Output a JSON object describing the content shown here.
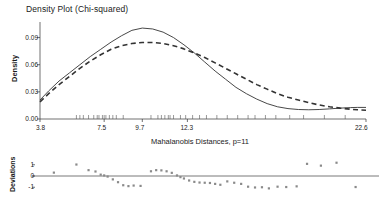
{
  "chart_data": [
    {
      "type": "line",
      "title": "Density Plot (Chi-squared)",
      "xlabel": "Mahalanobis Distances, p=11",
      "ylabel": "Density",
      "xlim": [
        3.8,
        22.6
      ],
      "ylim": [
        0.0,
        0.105
      ],
      "xticks": [
        3.8,
        7.5,
        9.7,
        12.3,
        22.6
      ],
      "xticklabels": [
        "3.8",
        "7.5",
        "9.7",
        "12.3",
        "22.6"
      ],
      "yticks": [
        0.0,
        0.03,
        0.06,
        0.09
      ],
      "yticklabels": [
        "0.00",
        "0.03",
        "0.06",
        "0.09"
      ],
      "grid": false,
      "legend": "none",
      "series": [
        {
          "name": "empirical-density",
          "style": "solid",
          "color": "#333333",
          "x": [
            3.8,
            4.3,
            4.9,
            5.5,
            6.1,
            6.7,
            7.3,
            7.9,
            8.5,
            9.1,
            9.7,
            10.3,
            10.9,
            11.5,
            12.1,
            12.7,
            13.3,
            13.9,
            14.5,
            15.1,
            15.7,
            16.3,
            16.9,
            17.5,
            18.1,
            18.7,
            19.3,
            19.9,
            20.5,
            21.1,
            21.7,
            22.1,
            22.6
          ],
          "y": [
            0.021,
            0.031,
            0.042,
            0.051,
            0.06,
            0.069,
            0.077,
            0.085,
            0.092,
            0.098,
            0.1005,
            0.0995,
            0.096,
            0.09,
            0.082,
            0.073,
            0.063,
            0.053,
            0.044,
            0.035,
            0.028,
            0.022,
            0.017,
            0.0135,
            0.0115,
            0.0105,
            0.0102,
            0.0105,
            0.0112,
            0.012,
            0.0126,
            0.0128,
            0.0128
          ]
        },
        {
          "name": "theoretical-chi-squared-density",
          "style": "dashed",
          "color": "#333333",
          "x": [
            3.8,
            4.3,
            4.9,
            5.5,
            6.1,
            6.7,
            7.3,
            7.9,
            8.5,
            9.1,
            9.7,
            10.3,
            10.9,
            11.5,
            12.1,
            12.7,
            13.3,
            13.9,
            14.5,
            15.1,
            15.7,
            16.3,
            16.9,
            17.5,
            18.1,
            18.7,
            19.3,
            19.9,
            20.5,
            21.1,
            21.7,
            22.1,
            22.6
          ],
          "y": [
            0.019,
            0.028,
            0.038,
            0.047,
            0.056,
            0.064,
            0.071,
            0.077,
            0.081,
            0.0835,
            0.0845,
            0.0845,
            0.0835,
            0.081,
            0.0775,
            0.073,
            0.068,
            0.062,
            0.056,
            0.05,
            0.044,
            0.038,
            0.033,
            0.028,
            0.024,
            0.021,
            0.018,
            0.0155,
            0.0135,
            0.012,
            0.0108,
            0.0102,
            0.0097
          ]
        }
      ],
      "rug_marks": [
        5.9,
        6.1,
        6.3,
        6.6,
        6.9,
        7.1,
        7.2,
        7.4,
        7.5,
        7.6,
        7.8,
        8.0,
        8.2,
        8.6,
        10.2,
        10.6,
        10.8,
        11.0,
        11.2,
        11.3,
        11.5,
        11.9,
        12.2,
        12.6,
        13.0,
        13.4,
        14.0,
        14.6,
        15.2,
        15.8,
        16.2,
        16.8,
        17.4,
        18.2,
        19.0,
        20.2,
        21.4
      ]
    },
    {
      "type": "scatter",
      "title": "",
      "xlabel": "",
      "ylabel": "Deviations",
      "xlim": [
        3.8,
        22.6
      ],
      "ylim": [
        -1.6,
        1.6
      ],
      "yticks": [
        -1,
        0,
        1
      ],
      "yticklabels": [
        "-1",
        "0",
        "1"
      ],
      "grid": false,
      "legend": "none",
      "reference_line": 0,
      "marker_color": "#8a8a8a",
      "points": [
        {
          "x": 4.6,
          "y": 0.3
        },
        {
          "x": 5.9,
          "y": 1.02
        },
        {
          "x": 6.6,
          "y": 0.52
        },
        {
          "x": 7.0,
          "y": 0.4
        },
        {
          "x": 7.3,
          "y": 0.12
        },
        {
          "x": 7.5,
          "y": 0.05
        },
        {
          "x": 7.7,
          "y": -0.05
        },
        {
          "x": 8.0,
          "y": -0.3
        },
        {
          "x": 8.3,
          "y": -0.55
        },
        {
          "x": 8.6,
          "y": -0.82
        },
        {
          "x": 8.9,
          "y": -0.9
        },
        {
          "x": 9.2,
          "y": -0.85
        },
        {
          "x": 9.6,
          "y": -0.88
        },
        {
          "x": 10.2,
          "y": 0.42
        },
        {
          "x": 10.5,
          "y": 0.52
        },
        {
          "x": 10.8,
          "y": 0.5
        },
        {
          "x": 11.1,
          "y": 0.42
        },
        {
          "x": 11.4,
          "y": 0.28
        },
        {
          "x": 11.7,
          "y": 0.05
        },
        {
          "x": 11.9,
          "y": -0.1
        },
        {
          "x": 12.1,
          "y": -0.22
        },
        {
          "x": 12.4,
          "y": -0.4
        },
        {
          "x": 12.7,
          "y": -0.52
        },
        {
          "x": 13.0,
          "y": -0.58
        },
        {
          "x": 13.3,
          "y": -0.6
        },
        {
          "x": 13.6,
          "y": -0.62
        },
        {
          "x": 13.9,
          "y": -0.7
        },
        {
          "x": 14.2,
          "y": -0.78
        },
        {
          "x": 14.6,
          "y": -0.48
        },
        {
          "x": 15.0,
          "y": -0.6
        },
        {
          "x": 15.4,
          "y": -0.7
        },
        {
          "x": 15.8,
          "y": -0.95
        },
        {
          "x": 16.2,
          "y": -1.02
        },
        {
          "x": 16.6,
          "y": -1.0
        },
        {
          "x": 17.0,
          "y": -1.1
        },
        {
          "x": 17.5,
          "y": -0.95
        },
        {
          "x": 18.0,
          "y": -0.98
        },
        {
          "x": 18.6,
          "y": -0.92
        },
        {
          "x": 19.2,
          "y": 1.08
        },
        {
          "x": 20.0,
          "y": 0.92
        },
        {
          "x": 20.9,
          "y": 1.18
        },
        {
          "x": 22.0,
          "y": -0.98
        }
      ]
    }
  ]
}
